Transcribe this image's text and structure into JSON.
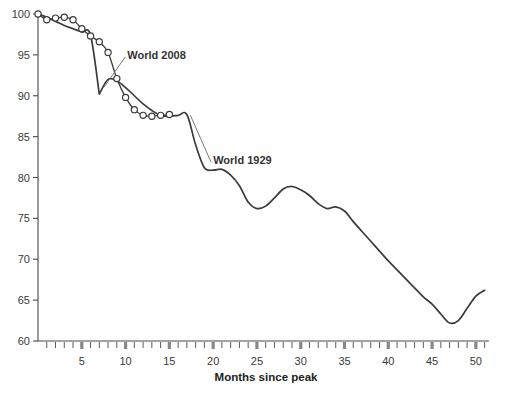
{
  "chart_data": {
    "type": "line",
    "title": "",
    "subtitle": "",
    "xlabel": "Months since peak",
    "ylabel": "",
    "xlim": [
      0,
      51.5
    ],
    "ylim": [
      60,
      100
    ],
    "xticks": [
      0,
      1,
      2,
      3,
      4,
      5,
      6,
      7,
      8,
      9,
      10,
      11,
      12,
      13,
      14,
      15,
      16,
      17,
      18,
      19,
      20,
      21,
      22,
      23,
      24,
      25,
      26,
      27,
      28,
      29,
      30,
      31,
      32,
      33,
      34,
      35,
      36,
      37,
      38,
      39,
      40,
      41,
      42,
      43,
      44,
      45,
      46,
      47,
      48,
      49,
      50,
      51
    ],
    "xtick_labels": [
      5,
      10,
      15,
      20,
      25,
      30,
      35,
      40,
      45,
      50
    ],
    "yticks": [
      60,
      65,
      70,
      75,
      80,
      85,
      90,
      95,
      100
    ],
    "ytick_labels": [
      "60",
      "65",
      "70",
      "75",
      "80",
      "85",
      "90",
      "95",
      "100"
    ],
    "grid": false,
    "legend_position": "inline-annotations",
    "series": [
      {
        "name": "World 1929",
        "marker": "none",
        "color": "#3b3b3b",
        "annotation": "World 1929",
        "x": [
          0,
          1,
          2,
          3,
          4,
          5,
          6,
          7,
          8,
          9,
          10,
          11,
          12,
          13,
          14,
          15,
          16,
          17,
          18,
          19,
          20,
          21,
          22,
          23,
          24,
          25,
          26,
          27,
          28,
          29,
          30,
          31,
          32,
          33,
          34,
          35,
          36,
          37,
          38,
          39,
          40,
          41,
          42,
          43,
          44,
          45,
          46,
          47,
          48,
          49,
          50,
          51
        ],
        "values": [
          100.0,
          99.6,
          99.1,
          98.6,
          98.2,
          97.8,
          97.4,
          90.2,
          92.0,
          91.8,
          91.0,
          90.0,
          89.0,
          88.2,
          87.6,
          87.5,
          87.6,
          87.7,
          84.0,
          81.2,
          80.9,
          81.0,
          80.3,
          79.0,
          77.0,
          76.2,
          76.5,
          77.5,
          78.6,
          78.9,
          78.5,
          77.8,
          76.8,
          76.2,
          76.4,
          75.9,
          74.6,
          73.4,
          72.2,
          71.0,
          69.8,
          68.7,
          67.6,
          66.5,
          65.4,
          64.5,
          63.3,
          62.2,
          62.5,
          64.0,
          65.5,
          66.2
        ]
      },
      {
        "name": "World 2008",
        "marker": "open-circle",
        "color": "#3b3b3b",
        "annotation": "World 2008",
        "x": [
          0,
          1,
          2,
          3,
          4,
          5,
          6,
          7,
          8,
          9,
          10,
          11,
          12,
          13,
          14,
          15
        ],
        "values": [
          100.0,
          99.3,
          99.5,
          99.6,
          99.3,
          98.2,
          97.3,
          96.6,
          95.3,
          92.1,
          89.8,
          88.3,
          87.6,
          87.5,
          87.6,
          87.7
        ]
      }
    ],
    "annotations": [
      {
        "text": "World 2008",
        "x": 10.2,
        "y": 95.0
      },
      {
        "text": "World 1929",
        "x": 20.0,
        "y": 82.1
      }
    ],
    "colors": {
      "background": "#ffffff",
      "axis": "#4a4a4a",
      "curve": "#3b3b3b",
      "marker_fill": "#ffffff",
      "text": "#333333",
      "tick_major": "#888888"
    }
  },
  "axis": {
    "x_title": "Months since peak"
  }
}
